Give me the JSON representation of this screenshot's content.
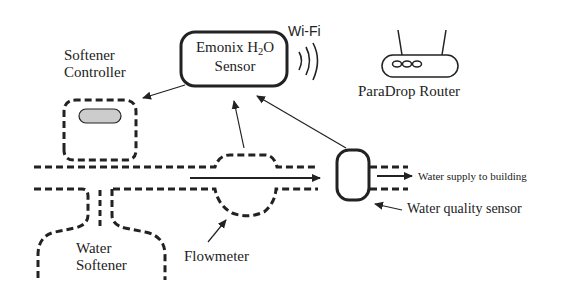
{
  "sensor": {
    "title_prefix": "Emonix H",
    "subscript": "2",
    "title_suffix": "O",
    "line2": "Sensor"
  },
  "wifi_label": "Wi-Fi",
  "router_label": "ParaDrop Router",
  "softener_controller": {
    "line1": "Softener",
    "line2": "Controller"
  },
  "water_softener": {
    "line1": "Water",
    "line2": "Softener"
  },
  "flowmeter_label": "Flowmeter",
  "water_supply_label": "Water supply to building",
  "water_quality_label": "Water quality sensor",
  "colors": {
    "stroke": "#222222",
    "controller_fill": "#cccccc",
    "background": "#ffffff"
  }
}
